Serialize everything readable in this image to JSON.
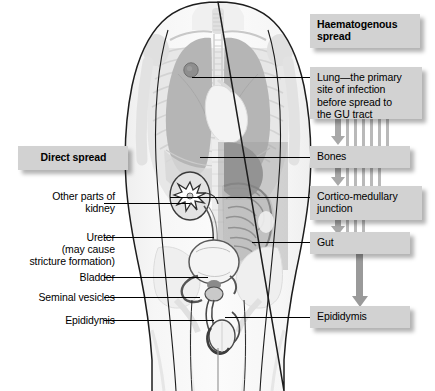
{
  "headers": {
    "haematogenous": "Haematogenous\nspread",
    "direct": "Direct spread"
  },
  "right_flow": {
    "boxes": [
      {
        "id": "lung",
        "label": "Lung—the primary\nsite of infection\nbefore spread to\nthe GU tract"
      },
      {
        "id": "bones",
        "label": "Bones"
      },
      {
        "id": "cmj",
        "label": "Cortico-medullary\njunction"
      },
      {
        "id": "gut",
        "label": "Gut"
      },
      {
        "id": "epididymis",
        "label": "Epididymis"
      }
    ]
  },
  "left_labels": [
    {
      "id": "other-kidney",
      "label": "Other parts of\nkidney"
    },
    {
      "id": "ureter",
      "label": "Ureter\n(may cause\nstricture formation)"
    },
    {
      "id": "bladder",
      "label": "Bladder"
    },
    {
      "id": "seminal-vesicles",
      "label": "Seminal vesicles"
    },
    {
      "id": "epididymis",
      "label": "Epididymis"
    }
  ],
  "anatomy": {
    "view": "anterior male torso",
    "structures": [
      "lungs",
      "trachea",
      "ribcage",
      "heart-shadow",
      "liver",
      "stomach",
      "bowel",
      "kidney",
      "ureter",
      "bladder",
      "seminal-vesicles",
      "prostate",
      "epididymis",
      "testis",
      "pelvis",
      "spine"
    ],
    "lesion": "tuberculous focus in right upper lung"
  },
  "colors": {
    "box_fill": "#d2d2d2",
    "arrow": "#a8a8a8",
    "vessel": "#b9b9b9",
    "line": "#000000",
    "lesion": "#8e8e8e",
    "lung": "#b5b5b5",
    "organ_dark": "#6e6e6e",
    "body": "#f2f2f2"
  }
}
